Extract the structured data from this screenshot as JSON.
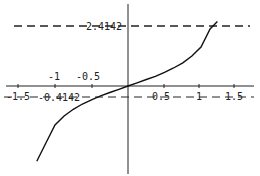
{
  "chart_data": {
    "type": "line",
    "title": "",
    "xlabel": "",
    "ylabel": "",
    "function": "y = tan(x/2)",
    "x_tick_labels_above": [
      "-1",
      "-0.5"
    ],
    "x_tick_labels_below": [
      "-1.5",
      "0.5",
      "1",
      "1.5"
    ],
    "x_ticks": [
      -1.5,
      -1,
      -0.5,
      0.5,
      1,
      1.5
    ],
    "reference_lines": [
      {
        "y": 2.4142,
        "label": "2.4142",
        "style": "dashed"
      },
      {
        "y": -0.4142,
        "label": "-0.4142",
        "style": "dashed"
      }
    ],
    "series": [
      {
        "name": "curve",
        "x": [
          -2.5,
          -2.25,
          -2.0,
          -1.75,
          -1.5,
          -1.25,
          -1.0,
          -0.75,
          -0.5,
          -0.25,
          0.0,
          0.25,
          0.5,
          0.75,
          1.0,
          1.25,
          1.5,
          1.75,
          2.0,
          2.25,
          2.45
        ],
        "y": [
          -3.01,
          -2.28,
          -1.56,
          -1.2,
          -0.93,
          -0.72,
          -0.55,
          -0.39,
          -0.26,
          -0.13,
          0.0,
          0.13,
          0.26,
          0.39,
          0.55,
          0.72,
          0.93,
          1.2,
          1.56,
          2.28,
          2.58
        ]
      }
    ],
    "grid": false,
    "legend": "none"
  },
  "labels": {
    "top_dash": "2.4142",
    "bottom_dash": "-0.4142",
    "tick_m1": "-1",
    "tick_m05": "-0.5",
    "tick_m15": "-1.5",
    "tick_05": "0.5",
    "tick_1": "1",
    "tick_15": "1.5"
  }
}
